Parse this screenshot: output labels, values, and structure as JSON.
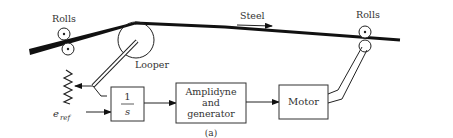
{
  "diagram": {
    "caption": "(a)",
    "labels": {
      "rolls_left": "Rolls",
      "rolls_right": "Rolls",
      "steel": "Steel",
      "looper": "Looper",
      "e_ref_main": "e",
      "e_ref_sub": "ref"
    },
    "blocks": {
      "integrator_num": "1",
      "integrator_den": "s",
      "amplidyne_line1": "Amplidyne",
      "amplidyne_line2": "and",
      "amplidyne_line3": "generator",
      "motor": "Motor"
    },
    "edges": [
      {
        "from": "looper-arm",
        "to": "potentiometer"
      },
      {
        "from": "potentiometer",
        "to": "integrator-block"
      },
      {
        "from": "e-ref",
        "to": "integrator-block"
      },
      {
        "from": "integrator-block",
        "to": "amplidyne-block"
      },
      {
        "from": "amplidyne-block",
        "to": "motor-block"
      },
      {
        "from": "motor-block",
        "to": "right-rolls"
      }
    ],
    "colors": {
      "line": "#111111",
      "text": "#333333"
    }
  }
}
